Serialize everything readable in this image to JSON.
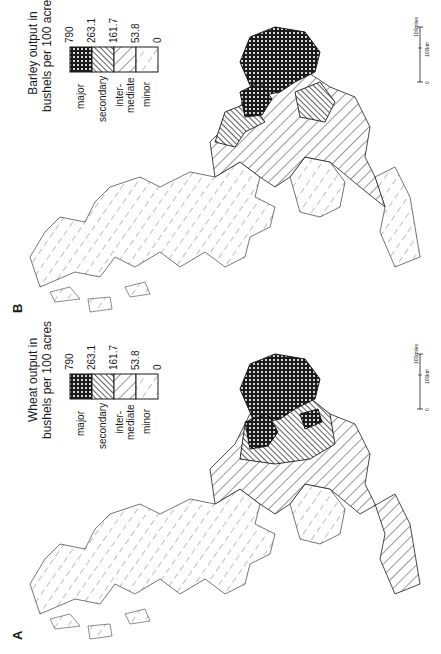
{
  "figure": {
    "panels": [
      {
        "id": "B",
        "letter": "B",
        "crop": "Barley",
        "legend": {
          "title_line1": "Barley output in",
          "title_line2": "bushels per 100 acres",
          "classes": [
            {
              "label": "major",
              "pattern": "cross-hatch",
              "from": "263.1",
              "to": "790"
            },
            {
              "label": "secondary",
              "pattern": "dense-diagonal",
              "from": "161.7",
              "to": "263.1"
            },
            {
              "label_line1": "inter-",
              "label_line2": "mediate",
              "pattern": "chevron",
              "from": "53.8",
              "to": "161.7"
            },
            {
              "label": "minor",
              "pattern": "sparse-dash",
              "from": "0",
              "to": "53.8"
            }
          ],
          "breaks": [
            "790",
            "263.1",
            "161.7",
            "53.8",
            "0"
          ]
        },
        "scale": {
          "zero": "0",
          "miles_label": "100miles",
          "km_label": "100km"
        }
      },
      {
        "id": "A",
        "letter": "A",
        "crop": "Wheat",
        "legend": {
          "title_line1": "Wheat output in",
          "title_line2": "bushels per 100 acres",
          "classes": [
            {
              "label": "major",
              "pattern": "cross-hatch",
              "from": "263.1",
              "to": "790"
            },
            {
              "label": "secondary",
              "pattern": "dense-diagonal",
              "from": "161.7",
              "to": "263.1"
            },
            {
              "label_line1": "inter-",
              "label_line2": "mediate",
              "pattern": "chevron",
              "from": "53.8",
              "to": "161.7"
            },
            {
              "label": "minor",
              "pattern": "sparse-dash",
              "from": "0",
              "to": "53.8"
            }
          ],
          "breaks": [
            "790",
            "263.1",
            "161.7",
            "53.8",
            "0"
          ]
        },
        "scale": {
          "zero": "0",
          "miles_label": "100miles",
          "km_label": "100km"
        }
      }
    ],
    "colors": {
      "ink": "#1a1a1a",
      "paper": "#ffffff"
    }
  }
}
